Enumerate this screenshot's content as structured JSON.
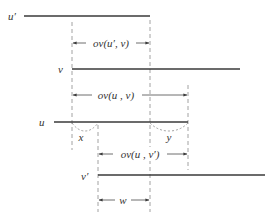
{
  "diagram": {
    "type": "overlap-intervals",
    "colors": {
      "segment": "#3a3a3a",
      "guide": "#8a8a8a",
      "text": "#333333"
    },
    "segments": [
      {
        "id": "u-prime",
        "label": "u′",
        "x1": 24,
        "x2": 150,
        "y": 16
      },
      {
        "id": "v",
        "label": "v",
        "x1": 72,
        "x2": 240,
        "y": 69
      },
      {
        "id": "u",
        "label": "u",
        "x1": 54,
        "x2": 188,
        "y": 122
      },
      {
        "id": "v-prime",
        "label": "v′",
        "x1": 98,
        "x2": 265,
        "y": 175
      }
    ],
    "dimensions": [
      {
        "id": "ov-u-prime-v",
        "label": "ov(u′, v)",
        "x1": 72,
        "x2": 150,
        "y": 43
      },
      {
        "id": "ov-u-v",
        "label": "ov(u , v)",
        "x1": 72,
        "x2": 188,
        "y": 95
      },
      {
        "id": "ov-u-v-prime",
        "label": "ov(u , v′)",
        "x1": 98,
        "x2": 188,
        "y": 154
      },
      {
        "id": "w",
        "label": "w",
        "x1": 98,
        "x2": 150,
        "y": 200
      }
    ],
    "braces": [
      {
        "id": "x",
        "label": "x",
        "x1": 72,
        "x2": 98,
        "y": 122
      },
      {
        "id": "y",
        "label": "y",
        "x1": 150,
        "x2": 188,
        "y": 122
      }
    ]
  }
}
